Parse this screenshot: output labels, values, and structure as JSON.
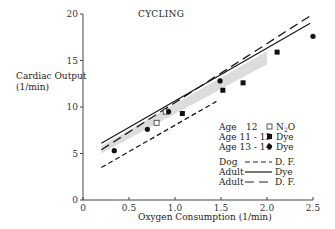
{
  "chart_data": {
    "type": "scatter",
    "title": "CYCLING",
    "xlabel": "Oxygen Consumption (1/min)",
    "ylabel": "Cardiac Output (1/min)",
    "ylabel_lines": [
      "Cardiac Output",
      "(1/min)"
    ],
    "xlim": [
      0,
      2.5
    ],
    "ylim": [
      0,
      20
    ],
    "xticks": [
      "0",
      "0.5",
      "1.0",
      "1.5",
      "2.0",
      "2.5"
    ],
    "yticks": [
      "0",
      "5",
      "10",
      "15",
      "20"
    ],
    "grid": false,
    "legend_position": "lower right",
    "series": [
      {
        "name": "Age 12 N2O",
        "marker": "open-square",
        "points": [
          [
            0.8,
            8.3
          ],
          [
            0.9,
            9.5
          ]
        ]
      },
      {
        "name": "Age 11-13 Dye",
        "marker": "filled-square",
        "points": [
          [
            1.08,
            9.3
          ],
          [
            1.52,
            11.8
          ],
          [
            1.74,
            12.6
          ],
          [
            2.11,
            15.9
          ]
        ]
      },
      {
        "name": "Age 13-14 Dye",
        "marker": "filled-circle",
        "points": [
          [
            0.34,
            5.3
          ],
          [
            0.7,
            7.6
          ],
          [
            0.93,
            9.5
          ],
          [
            1.49,
            12.8
          ],
          [
            2.5,
            17.6
          ]
        ]
      }
    ],
    "lines": [
      {
        "name": "Dog D.F.",
        "style": "short-dash",
        "from": [
          0.2,
          3.5
        ],
        "to": [
          1.45,
          10.6
        ]
      },
      {
        "name": "Adult Dye",
        "style": "solid",
        "from": [
          0.2,
          6.1
        ],
        "to": [
          2.47,
          19.0
        ]
      },
      {
        "name": "Adult D.F.",
        "style": "long-dash",
        "from": [
          0.2,
          5.4
        ],
        "to": [
          2.47,
          19.8
        ]
      }
    ],
    "shaded_band": {
      "from_x": 0.2,
      "to_x": 2.0,
      "lower_start": 5.0,
      "upper_start": 5.8,
      "lower_end": 14.6,
      "upper_end": 16.0
    }
  },
  "legend": {
    "markers": [
      {
        "label_left": "Age",
        "label_mid": "12",
        "symbol": "open-square",
        "label_right": "N2O"
      },
      {
        "label_left": "Age 11 - 13",
        "symbol": "filled-square",
        "label_right": "Dye"
      },
      {
        "label_left": "Age 13 - 14",
        "symbol": "filled-circle",
        "label_right": "Dye"
      }
    ],
    "lines": [
      {
        "label_left": "Dog",
        "style": "short-dash",
        "label_right": "D. F."
      },
      {
        "label_left": "Adult",
        "style": "solid",
        "label_right": "Dye"
      },
      {
        "label_left": "Adult",
        "style": "long-dash",
        "label_right": "D. F."
      }
    ]
  }
}
